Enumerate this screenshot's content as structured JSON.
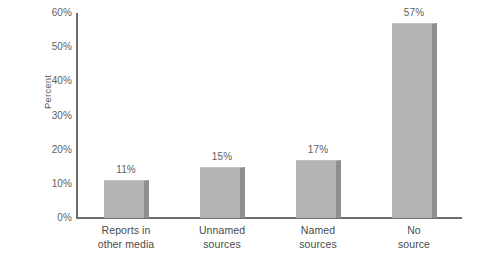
{
  "chart_data": {
    "type": "bar",
    "title": "",
    "subtitle": "",
    "xlabel": "",
    "ylabel": "Percent",
    "ylim": [
      0,
      60
    ],
    "yticks": [
      "0%",
      "10%",
      "20%",
      "30%",
      "40%",
      "50%",
      "60%"
    ],
    "ytick_values": [
      0,
      10,
      20,
      30,
      40,
      50,
      60
    ],
    "grid": false,
    "legend": false,
    "categories": [
      "Reports in other media",
      "Unnamed sources",
      "Named sources",
      "No source"
    ],
    "category_lines": [
      [
        "Reports in",
        "other media"
      ],
      [
        "Unnamed",
        "sources"
      ],
      [
        "Named",
        "sources"
      ],
      [
        "No",
        "source"
      ]
    ],
    "values": [
      11,
      15,
      17,
      57
    ],
    "value_labels": [
      "11%",
      "15%",
      "17%",
      "57%"
    ],
    "colors": {
      "bar_fill": "#b4b4b4",
      "bar_edge": "#8f8f8f",
      "axis": "#6e6e6e",
      "text": "#5e5e5e",
      "background": "#ffffff"
    }
  }
}
